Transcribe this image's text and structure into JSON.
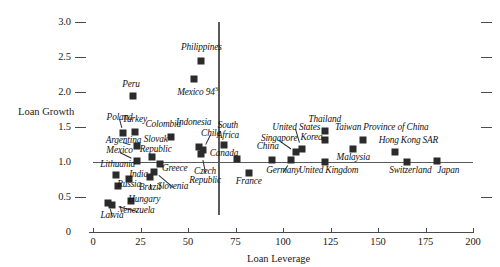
{
  "chart_data": {
    "type": "scatter",
    "title": "",
    "xlabel": "Loan Leverage",
    "ylabel": "Loan Growth",
    "xlim": [
      0,
      200
    ],
    "ylim": [
      0,
      3.0
    ],
    "xticks": [
      "0",
      "25",
      "50",
      "75",
      "100",
      "125",
      "150",
      "175",
      "200"
    ],
    "xtick_values": [
      0,
      25,
      50,
      75,
      100,
      125,
      150,
      175,
      200
    ],
    "yticks": [
      "0",
      "0.5",
      "1.0",
      "1.5",
      "2.0",
      "2.5",
      "3.0"
    ],
    "ytick_values": [
      0,
      0.5,
      1.0,
      1.5,
      2.0,
      2.5,
      3.0
    ],
    "grid": false,
    "legend": null,
    "reference_lines": [
      {
        "axis": "y",
        "value": 1.0,
        "name": "loan-growth-reference-line"
      },
      {
        "axis": "x",
        "value": 66,
        "name": "loan-leverage-reference-line"
      }
    ],
    "points": [
      {
        "label": "Poland",
        "x": 16,
        "y": 1.42,
        "lx": 14,
        "ly": 1.62,
        "anchor": "center",
        "leader": true
      },
      {
        "label": "Turkey",
        "x": 22,
        "y": 1.43,
        "lx": 22,
        "ly": 1.59,
        "anchor": "center",
        "leader": false
      },
      {
        "label": "Colombia",
        "x": 41,
        "y": 1.36,
        "lx": 37,
        "ly": 1.52,
        "anchor": "center",
        "leader": false
      },
      {
        "label": "Argentina",
        "x": 23,
        "y": 1.23,
        "lx": 16,
        "ly": 1.29,
        "anchor": "center",
        "leader": true
      },
      {
        "label": "Mexico",
        "x": 23,
        "y": 1.02,
        "lx": 14,
        "ly": 1.14,
        "anchor": "center",
        "leader": true
      },
      {
        "label": "Slovak Republic",
        "x": 31,
        "y": 1.07,
        "lx": 33,
        "ly": 1.3,
        "anchor": "center",
        "leader": false
      },
      {
        "label": "Lithuania",
        "x": 12,
        "y": 0.82,
        "lx": 13,
        "ly": 0.94,
        "anchor": "center",
        "leader": false
      },
      {
        "label": "India",
        "x": 19,
        "y": 0.76,
        "lx": 24,
        "ly": 0.8,
        "anchor": "center",
        "leader": false
      },
      {
        "label": "Russia",
        "x": 13,
        "y": 0.66,
        "lx": 19,
        "ly": 0.66,
        "anchor": "center",
        "leader": false
      },
      {
        "label": "Brazil",
        "x": 30,
        "y": 0.78,
        "lx": 30,
        "ly": 0.62,
        "anchor": "center",
        "leader": true
      },
      {
        "label": "Slovenia",
        "x": 32,
        "y": 0.86,
        "lx": 42,
        "ly": 0.63,
        "anchor": "center",
        "leader": true
      },
      {
        "label": "Greece",
        "x": 35,
        "y": 0.97,
        "lx": 43,
        "ly": 0.88,
        "anchor": "center",
        "leader": false
      },
      {
        "label": "Hungary",
        "x": 20,
        "y": 0.45,
        "lx": 27,
        "ly": 0.45,
        "anchor": "center",
        "leader": false
      },
      {
        "label": "Latvia",
        "x": 8,
        "y": 0.41,
        "lx": 10,
        "ly": 0.22,
        "anchor": "center",
        "leader": true
      },
      {
        "label": "Venezuela",
        "x": 10,
        "y": 0.38,
        "lx": 23,
        "ly": 0.29,
        "anchor": "center",
        "leader": true
      },
      {
        "label": "Peru",
        "x": 21,
        "y": 1.95,
        "lx": 20,
        "ly": 2.08,
        "anchor": "center",
        "leader": false
      },
      {
        "label": "Mexico 94",
        "x": 53,
        "y": 2.18,
        "lx": 55,
        "ly": 2.0,
        "anchor": "center",
        "leader": false,
        "sup": "3"
      },
      {
        "label": "Philippines",
        "x": 57,
        "y": 2.45,
        "lx": 57,
        "ly": 2.62,
        "anchor": "center",
        "leader": false
      },
      {
        "label": "Indonesia",
        "x": 56,
        "y": 1.22,
        "lx": 53,
        "ly": 1.55,
        "anchor": "center",
        "leader": false
      },
      {
        "label": "Chile",
        "x": 58,
        "y": 1.17,
        "lx": 62,
        "ly": 1.39,
        "anchor": "center",
        "leader": true
      },
      {
        "label": "Czech Republic",
        "x": 57,
        "y": 1.12,
        "lx": 59,
        "ly": 0.85,
        "anchor": "center",
        "leader": true
      },
      {
        "label": "South Africa",
        "x": 69,
        "y": 1.25,
        "lx": 71,
        "ly": 1.5,
        "anchor": "center",
        "leader": false
      },
      {
        "label": "Canada",
        "x": 76,
        "y": 1.05,
        "lx": 69,
        "ly": 1.1,
        "anchor": "center",
        "leader": false
      },
      {
        "label": "France",
        "x": 82,
        "y": 0.84,
        "lx": 82,
        "ly": 0.7,
        "anchor": "center",
        "leader": false
      },
      {
        "label": "China",
        "x": 94,
        "y": 1.03,
        "lx": 92,
        "ly": 1.2,
        "anchor": "center",
        "leader": false
      },
      {
        "label": "Germany",
        "x": 104,
        "y": 1.03,
        "lx": 100,
        "ly": 0.86,
        "anchor": "center",
        "leader": true
      },
      {
        "label": "Singapore",
        "x": 107,
        "y": 1.14,
        "lx": 98,
        "ly": 1.31,
        "anchor": "center",
        "leader": true
      },
      {
        "label": "United States",
        "x": 110,
        "y": 1.19,
        "lx": 107,
        "ly": 1.47,
        "anchor": "center",
        "leader": true
      },
      {
        "label": "Korea",
        "x": 122,
        "y": 1.32,
        "lx": 115,
        "ly": 1.33,
        "anchor": "center",
        "leader": false
      },
      {
        "label": "Thailand",
        "x": 122,
        "y": 1.44,
        "lx": 122,
        "ly": 1.58,
        "anchor": "center",
        "leader": false
      },
      {
        "label": "United Kingdom",
        "x": 122,
        "y": 1.0,
        "lx": 124,
        "ly": 0.86,
        "anchor": "center",
        "leader": false
      },
      {
        "label": "Malaysia",
        "x": 137,
        "y": 1.18,
        "lx": 137,
        "ly": 1.04,
        "anchor": "center",
        "leader": false
      },
      {
        "label": "Taiwan Province of China",
        "x": 142,
        "y": 1.32,
        "lx": 152,
        "ly": 1.47,
        "anchor": "center",
        "leader": false
      },
      {
        "label": "Hong Kong SAR",
        "x": 159,
        "y": 1.14,
        "lx": 166,
        "ly": 1.29,
        "anchor": "center",
        "leader": false
      },
      {
        "label": "Switzerland",
        "x": 165,
        "y": 1.0,
        "lx": 167,
        "ly": 0.86,
        "anchor": "center",
        "leader": false
      },
      {
        "label": "Japan",
        "x": 181,
        "y": 1.02,
        "lx": 187,
        "ly": 0.86,
        "anchor": "center",
        "leader": false
      }
    ],
    "colors": {
      "marker": "#2b2b2b",
      "axis": "#4a4a4a",
      "text": "#121212",
      "background": "#ffffff"
    }
  }
}
